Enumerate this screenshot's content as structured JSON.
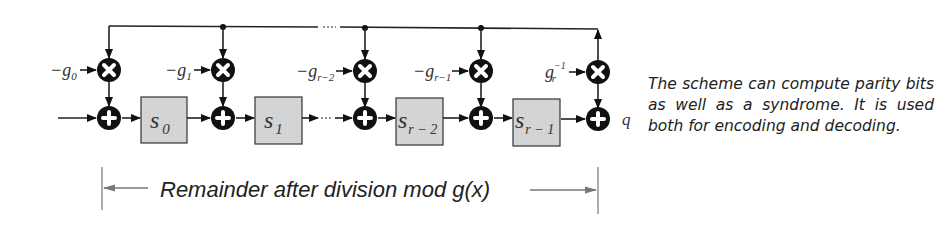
{
  "diagram": {
    "coefficients": [
      {
        "sign": "−",
        "base": "g",
        "sub": "0",
        "sup": ""
      },
      {
        "sign": "−",
        "base": "g",
        "sub": "1",
        "sup": ""
      },
      {
        "sign": "−",
        "base": "g",
        "sub": "r−2",
        "sup": ""
      },
      {
        "sign": "−",
        "base": "g",
        "sub": "r−1",
        "sup": ""
      },
      {
        "sign": "",
        "base": "g",
        "sub": "r",
        "sup": "−1"
      }
    ],
    "registers": [
      {
        "base": "s",
        "sub": "0"
      },
      {
        "base": "s",
        "sub": "1"
      },
      {
        "base": "s",
        "sub": "r − 2"
      },
      {
        "base": "s",
        "sub": "r − 1"
      }
    ],
    "output_label": "q",
    "annotation": "Remainder after division mod g(x)",
    "operators": {
      "multiply": "×",
      "add": "+"
    },
    "colors": {
      "node_fill": "#111111",
      "register_fill": "#d3d3d3",
      "line": "#222222",
      "annotation_line": "#777777"
    }
  },
  "caption": "The scheme can compute parity bits as well as a syndrome. It is used both for encoding and decoding."
}
